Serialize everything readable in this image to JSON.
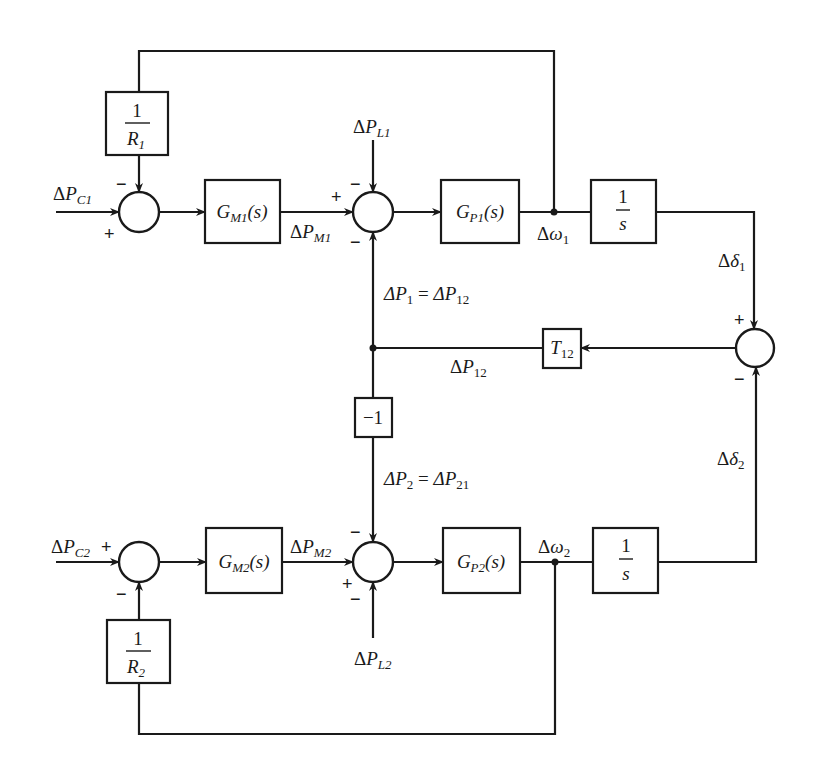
{
  "diagram": {
    "blocks": {
      "r1": {
        "num": "1",
        "den": "R",
        "den_sub": "1"
      },
      "gm1": {
        "main": "G",
        "sub": "M1",
        "arg": "(s)"
      },
      "gp1": {
        "main": "G",
        "sub": "P1",
        "arg": "(s)"
      },
      "int1": {
        "num": "1",
        "den": "s"
      },
      "t12": {
        "main": "T",
        "sub": "12"
      },
      "neg1": {
        "text": "−1"
      },
      "r2": {
        "num": "1",
        "den": "R",
        "den_sub": "2"
      },
      "gm2": {
        "main": "G",
        "sub": "M2",
        "arg": "(s)"
      },
      "gp2": {
        "main": "G",
        "sub": "P2",
        "arg": "(s)"
      },
      "int2": {
        "num": "1",
        "den": "s"
      }
    },
    "signals": {
      "pc1": {
        "delta": "Δ",
        "main": "P",
        "sub": "C1"
      },
      "pm1": {
        "delta": "Δ",
        "main": "P",
        "sub": "M1"
      },
      "pl1": {
        "delta": "Δ",
        "main": "P",
        "sub": "L1"
      },
      "w1": {
        "delta": "Δ",
        "main": "ω",
        "sub": "1"
      },
      "d1": {
        "delta": "Δ",
        "main": "δ",
        "sub": "1"
      },
      "p1eq": {
        "lhs": "ΔP",
        "lhs_sub": "1",
        "eq": " = ",
        "rhs": "ΔP",
        "rhs_sub": "12"
      },
      "p12": {
        "delta": "Δ",
        "main": "P",
        "sub": "12"
      },
      "p2eq": {
        "lhs": "ΔP",
        "lhs_sub": "2",
        "eq": " = ",
        "rhs": "ΔP",
        "rhs_sub": "21"
      },
      "d2": {
        "delta": "Δ",
        "main": "δ",
        "sub": "2"
      },
      "pc2": {
        "delta": "Δ",
        "main": "P",
        "sub": "C2"
      },
      "pm2": {
        "delta": "Δ",
        "main": "P",
        "sub": "M2"
      },
      "w2": {
        "delta": "Δ",
        "main": "ω",
        "sub": "2"
      },
      "pl2": {
        "delta": "Δ",
        "main": "P",
        "sub": "L2"
      }
    },
    "signs": {
      "plus": "+",
      "minus": "−"
    }
  }
}
